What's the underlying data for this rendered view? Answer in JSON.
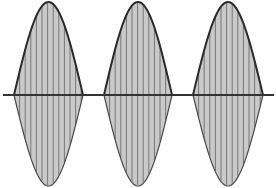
{
  "diagram": {
    "type": "amplitude-modulated-pulse-train",
    "width": 276,
    "height": 188,
    "axis": {
      "y": 95,
      "x_start": 3,
      "x_end": 274
    },
    "lobes": [
      {
        "x_start": 14,
        "x_end": 83,
        "peak_top": 2,
        "peak_bottom": 186
      },
      {
        "x_start": 104,
        "x_end": 172,
        "peak_top": 2,
        "peak_bottom": 186
      },
      {
        "x_start": 193,
        "x_end": 263,
        "peak_top": 2,
        "peak_bottom": 186
      }
    ],
    "hatch_spacing": 5.6,
    "colors": {
      "fill": "#c9c9c9",
      "hatch": "#6e6e6e",
      "outline_top": "#2a2a2a",
      "outline_bottom": "#4a4a4a",
      "axis": "#333333",
      "background": "#ffffff"
    }
  }
}
